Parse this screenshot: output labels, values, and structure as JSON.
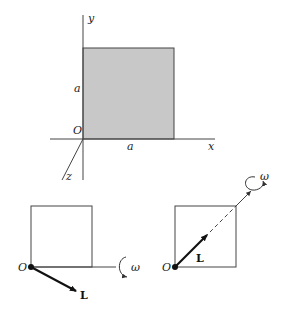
{
  "figure": {
    "top": {
      "axis_labels": {
        "x": "x",
        "y": "y",
        "z": "z"
      },
      "origin_label": "O",
      "side_label_vertical": "a",
      "side_label_horizontal": "a",
      "fill_color": "#c8c8c8"
    },
    "bottom_left": {
      "origin_label": "O",
      "vector_label": "L",
      "rotation_label": "ω"
    },
    "bottom_right": {
      "origin_label": "O",
      "vector_label": "L",
      "rotation_label": "ω"
    }
  }
}
